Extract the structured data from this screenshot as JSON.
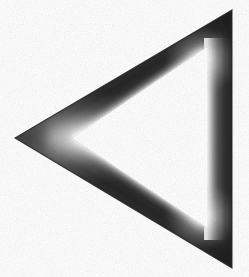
{
  "figure": {
    "title": "Triangular ring",
    "description": "Left-pointing hollow triangle outline with airbrushed gray shading",
    "alt_text": "A thick-bordered triangle pointing left, rendered in dark gray with soft light highlights on its inner edges, on a white background",
    "width": 249,
    "height": 277,
    "background_color": "#ffffff",
    "frame_color_dark": "#353535",
    "frame_color_mid": "#5c5c5c",
    "highlight_color": "#f2f2f2",
    "edge_color_darkest": "#262626",
    "orientation": "pointing-left",
    "shape_kind": "triangle-ring",
    "outer_vertices": [
      {
        "name": "left-apex",
        "x": 15,
        "y": 138
      },
      {
        "name": "top-right",
        "x": 232,
        "y": 10
      },
      {
        "name": "bottom-right",
        "x": 232,
        "y": 268
      }
    ],
    "inner_vertices": [
      {
        "name": "inner-left-apex",
        "x": 72,
        "y": 138
      },
      {
        "name": "inner-top-right",
        "x": 207,
        "y": 47
      },
      {
        "name": "inner-bottom-right",
        "x": 207,
        "y": 228
      }
    ],
    "edges": [
      {
        "name": "upper-left-edge",
        "shading": "dark-with-inner-highlight"
      },
      {
        "name": "lower-left-edge",
        "shading": "dark-with-inner-highlight"
      },
      {
        "name": "right-vertical-edge",
        "shading": "light-inner-to-dark-outer"
      }
    ]
  }
}
